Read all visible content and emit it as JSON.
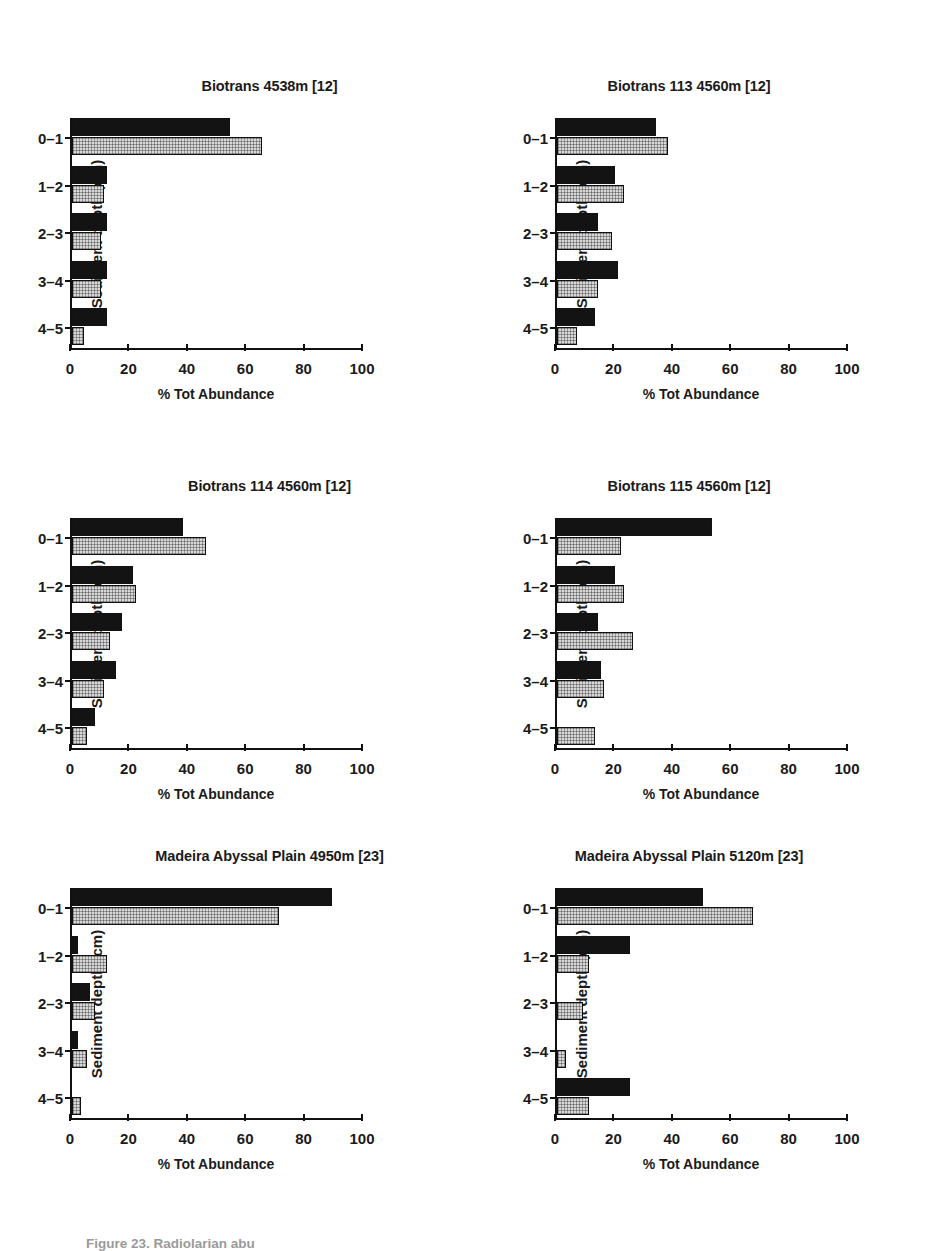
{
  "figure": {
    "caption": "Figure 23. Radiolarian abu",
    "ylabel": "Sediment depth (cm)",
    "xlabel": "% Tot Abundance",
    "depth_categories": [
      "0–1",
      "1–2",
      "2–3",
      "3–4",
      "4–5"
    ],
    "xticks": [
      0,
      20,
      40,
      60,
      80,
      100
    ],
    "xticklabels": [
      "0",
      "20",
      "40",
      "60",
      "80",
      "100"
    ],
    "series_names": [
      "dark",
      "light"
    ],
    "colors": {
      "dark": "#131313",
      "light": "#d8d8d8",
      "axis": "#111111",
      "background": "#ffffff"
    }
  },
  "chart_data": [
    {
      "type": "bar",
      "title": "Biotrans 4538m [12]",
      "xlabel": "% Tot Abundance",
      "ylabel": "Sediment depth (cm)",
      "categories": [
        "0–1",
        "1–2",
        "2–3",
        "3–4",
        "4–5"
      ],
      "xlim": [
        0,
        100
      ],
      "grid": false,
      "orientation": "horizontal",
      "series": [
        {
          "name": "dark",
          "values": [
            54,
            12,
            12,
            12,
            12
          ]
        },
        {
          "name": "light",
          "values": [
            65,
            11,
            10,
            10,
            4
          ]
        }
      ]
    },
    {
      "type": "bar",
      "title": "Biotrans 113 4560m [12]",
      "xlabel": "% Tot Abundance",
      "ylabel": "Sediment depth (cm)",
      "categories": [
        "0–1",
        "1–2",
        "2–3",
        "3–4",
        "4–5"
      ],
      "xlim": [
        0,
        100
      ],
      "grid": false,
      "orientation": "horizontal",
      "series": [
        {
          "name": "dark",
          "values": [
            34,
            20,
            14,
            21,
            13
          ]
        },
        {
          "name": "light",
          "values": [
            38,
            23,
            19,
            14,
            7
          ]
        }
      ]
    },
    {
      "type": "bar",
      "title": "Biotrans 114 4560m [12]",
      "xlabel": "% Tot Abundance",
      "ylabel": "Sediment depth (cm)",
      "categories": [
        "0–1",
        "1–2",
        "2–3",
        "3–4",
        "4–5"
      ],
      "xlim": [
        0,
        100
      ],
      "grid": false,
      "orientation": "horizontal",
      "series": [
        {
          "name": "dark",
          "values": [
            38,
            21,
            17,
            15,
            8
          ]
        },
        {
          "name": "light",
          "values": [
            46,
            22,
            13,
            11,
            5
          ]
        }
      ]
    },
    {
      "type": "bar",
      "title": "Biotrans 115 4560m [12]",
      "xlabel": "% Tot Abundance",
      "ylabel": "Sediment depth (cm)",
      "categories": [
        "0–1",
        "1–2",
        "2–3",
        "3–4",
        "4–5"
      ],
      "xlim": [
        0,
        100
      ],
      "grid": false,
      "orientation": "horizontal",
      "series": [
        {
          "name": "dark",
          "values": [
            53,
            20,
            14,
            15,
            0
          ]
        },
        {
          "name": "light",
          "values": [
            22,
            23,
            26,
            16,
            13
          ]
        }
      ]
    },
    {
      "type": "bar",
      "title": "Madeira Abyssal Plain 4950m [23]",
      "xlabel": "% Tot Abundance",
      "ylabel": "Sediment depth (cm)",
      "categories": [
        "0–1",
        "1–2",
        "2–3",
        "3–4",
        "4–5"
      ],
      "xlim": [
        0,
        100
      ],
      "grid": false,
      "orientation": "horizontal",
      "series": [
        {
          "name": "dark",
          "values": [
            89,
            2,
            6,
            2,
            0
          ]
        },
        {
          "name": "light",
          "values": [
            71,
            12,
            8,
            5,
            3
          ]
        }
      ]
    },
    {
      "type": "bar",
      "title": "Madeira Abyssal Plain 5120m [23]",
      "xlabel": "% Tot Abundance",
      "ylabel": "Sediment depth (cm)",
      "categories": [
        "0–1",
        "1–2",
        "2–3",
        "3–4",
        "4–5"
      ],
      "xlim": [
        0,
        100
      ],
      "grid": false,
      "orientation": "horizontal",
      "series": [
        {
          "name": "dark",
          "values": [
            50,
            25,
            0,
            0,
            25
          ]
        },
        {
          "name": "light",
          "values": [
            67,
            11,
            9,
            3,
            11
          ]
        }
      ]
    }
  ]
}
